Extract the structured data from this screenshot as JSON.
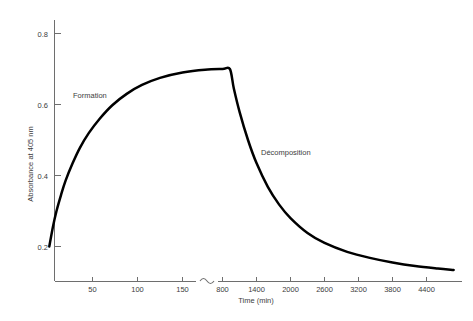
{
  "chart_data": {
    "type": "line",
    "title": "",
    "subtitle": "",
    "xlabel": "Time (min)",
    "ylabel": "Absorbance at 405 nm",
    "grid": false,
    "legend_position": "none",
    "axis_break": {
      "present": true,
      "symbol": "~",
      "between": [
        150,
        800
      ]
    },
    "ylim": [
      0.1,
      0.88
    ],
    "yticks": [
      0.2,
      0.4,
      0.6,
      0.8
    ],
    "ytick_labels": [
      "0.2",
      "0.4",
      "0.6",
      "0.8"
    ],
    "xlim_left": [
      0,
      190
    ],
    "xticks_left": [
      50,
      100,
      150
    ],
    "xtick_labels_left": [
      "50",
      "100",
      "150"
    ],
    "xlim_right": [
      700,
      4900
    ],
    "xticks_right": [
      800,
      1400,
      2000,
      2600,
      3200,
      3800,
      4400
    ],
    "xtick_labels_right": [
      "800",
      "1400",
      "2000",
      "2600",
      "3200",
      "3800",
      "4400"
    ],
    "annotations": [
      {
        "text": "Formation",
        "x": 35,
        "y": 0.615,
        "phase": "rise"
      },
      {
        "text": "Décomposition",
        "x": 2050,
        "y": 0.465,
        "phase": "decay"
      }
    ],
    "series": [
      {
        "name": "Absorbance",
        "color": "#000000",
        "points_formation": [
          {
            "x": 2,
            "y": 0.2
          },
          {
            "x": 6,
            "y": 0.255
          },
          {
            "x": 10,
            "y": 0.3
          },
          {
            "x": 15,
            "y": 0.345
          },
          {
            "x": 20,
            "y": 0.385
          },
          {
            "x": 28,
            "y": 0.435
          },
          {
            "x": 36,
            "y": 0.478
          },
          {
            "x": 46,
            "y": 0.52
          },
          {
            "x": 58,
            "y": 0.56
          },
          {
            "x": 72,
            "y": 0.598
          },
          {
            "x": 88,
            "y": 0.63
          },
          {
            "x": 105,
            "y": 0.655
          },
          {
            "x": 125,
            "y": 0.675
          },
          {
            "x": 150,
            "y": 0.69
          },
          {
            "x": 175,
            "y": 0.698
          },
          {
            "x": 800,
            "y": 0.7
          },
          {
            "x": 930,
            "y": 0.7
          }
        ],
        "points_decomposition": [
          {
            "x": 930,
            "y": 0.7
          },
          {
            "x": 1000,
            "y": 0.645
          },
          {
            "x": 1100,
            "y": 0.58
          },
          {
            "x": 1250,
            "y": 0.5
          },
          {
            "x": 1400,
            "y": 0.435
          },
          {
            "x": 1600,
            "y": 0.368
          },
          {
            "x": 1800,
            "y": 0.318
          },
          {
            "x": 2000,
            "y": 0.28
          },
          {
            "x": 2300,
            "y": 0.238
          },
          {
            "x": 2600,
            "y": 0.21
          },
          {
            "x": 3000,
            "y": 0.185
          },
          {
            "x": 3400,
            "y": 0.168
          },
          {
            "x": 3800,
            "y": 0.155
          },
          {
            "x": 4200,
            "y": 0.145
          },
          {
            "x": 4600,
            "y": 0.138
          },
          {
            "x": 4880,
            "y": 0.134
          }
        ],
        "peak": {
          "x": 930,
          "y": 0.7
        },
        "start": {
          "x": 2,
          "y": 0.2
        },
        "end": {
          "x": 4880,
          "y": 0.134
        }
      }
    ]
  },
  "axes": {
    "y_axis_title": "Absorbance at 405 nm",
    "x_axis_title": "Time (min)",
    "break_symbol": "~"
  },
  "annotations": {
    "formation": "Formation",
    "decomposition": "Décomposition"
  },
  "ytick_labels": {
    "t0": "0.2",
    "t1": "0.4",
    "t2": "0.6",
    "t3": "0.8"
  },
  "xtick_labels_left": {
    "t0": "50",
    "t1": "100",
    "t2": "150"
  },
  "xtick_labels_right": {
    "t0": "800",
    "t1": "1400",
    "t2": "2000",
    "t3": "2600",
    "t4": "3200",
    "t5": "3800",
    "t6": "4400"
  },
  "colors": {
    "curve": "#000000",
    "axis": "#6e6e6e",
    "text": "#3c3c3c",
    "background": "#ffffff"
  }
}
